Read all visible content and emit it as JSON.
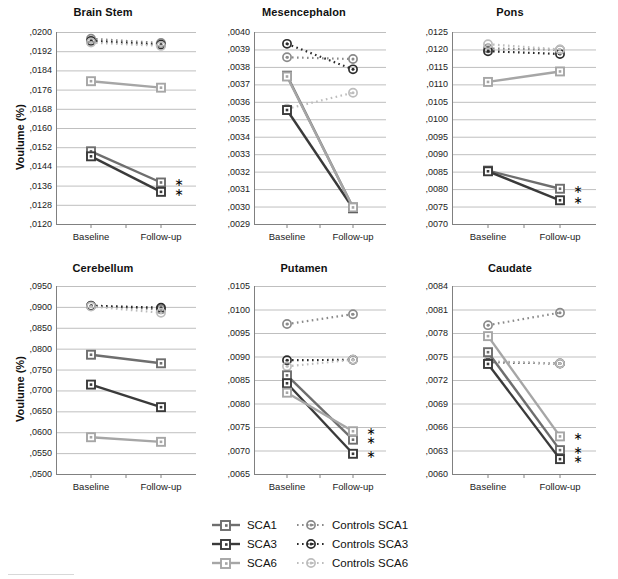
{
  "figure": {
    "y_axis_label": "Voulume (%)",
    "x_categories": [
      "Baseline",
      "Follow-up"
    ],
    "significance_marker": "∗",
    "colors": {
      "sca1": "#6e6e6e",
      "sca3": "#3a3a3a",
      "sca6": "#a6a6a6",
      "controls_sca1": "#8a8a8a",
      "controls_sca3": "#2b2b2b",
      "controls_sca6": "#bdbdbd",
      "gridline": "#bfbfbf",
      "axis": "#808080",
      "text": "#1a1a1a"
    }
  },
  "legend": {
    "entries": [
      {
        "label": "SCA1",
        "series_key": "sca1",
        "style": "solid-square"
      },
      {
        "label": "Controls SCA1",
        "series_key": "controls_sca1",
        "style": "dotted-circle"
      },
      {
        "label": "SCA3",
        "series_key": "sca3",
        "style": "solid-square"
      },
      {
        "label": "Controls SCA3",
        "series_key": "controls_sca3",
        "style": "dotted-circle"
      },
      {
        "label": "SCA6",
        "series_key": "sca6",
        "style": "solid-square"
      },
      {
        "label": "Controls SCA6",
        "series_key": "controls_sca6",
        "style": "dotted-circle"
      }
    ]
  },
  "chart_data": [
    {
      "type": "line",
      "title": "Brain Stem",
      "xlabel": "",
      "ylabel": "Voulume (%)",
      "x": [
        "Baseline",
        "Follow-up"
      ],
      "ylim": [
        0.012,
        0.02
      ],
      "ytick_step": 0.0008,
      "ytick_labels": [
        ",0120",
        ",0128",
        ",0136",
        ",0144",
        ",0152",
        ",0160",
        ",0168",
        ",0176",
        ",0184",
        ",0192",
        ",0200"
      ],
      "grid": true,
      "legend_position": "figure-bottom",
      "series": [
        {
          "name": "SCA1",
          "key": "sca1",
          "style": "solid-square",
          "values": [
            0.01503,
            0.01373
          ],
          "significant": true
        },
        {
          "name": "SCA3",
          "key": "sca3",
          "style": "solid-square",
          "values": [
            0.01482,
            0.01334
          ],
          "significant": true
        },
        {
          "name": "SCA6",
          "key": "sca6",
          "style": "solid-square",
          "values": [
            0.01795,
            0.01768
          ],
          "significant": false
        },
        {
          "name": "Controls SCA1",
          "key": "controls_sca1",
          "style": "dotted-circle",
          "values": [
            0.01972,
            0.01954
          ],
          "significant": false
        },
        {
          "name": "Controls SCA3",
          "key": "controls_sca3",
          "style": "dotted-circle",
          "values": [
            0.01963,
            0.01947
          ],
          "significant": false
        },
        {
          "name": "Controls SCA6",
          "key": "controls_sca6",
          "style": "dotted-circle",
          "values": [
            0.01956,
            0.01942
          ],
          "significant": false
        }
      ]
    },
    {
      "type": "line",
      "title": "Mesencephalon",
      "xlabel": "",
      "ylabel": "",
      "x": [
        "Baseline",
        "Follow-up"
      ],
      "ylim": [
        0.0029,
        0.004
      ],
      "ytick_step": 0.0001,
      "ytick_labels": [
        ",0029",
        ",0030",
        ",0031",
        ",0032",
        ",0033",
        ",0034",
        ",0035",
        ",0036",
        ",0037",
        ",0038",
        ",0039",
        ",0040"
      ],
      "grid": true,
      "legend_position": "figure-bottom",
      "series": [
        {
          "name": "SCA1",
          "key": "sca1",
          "style": "solid-square",
          "values": [
            0.00375,
            0.002995
          ],
          "significant": false
        },
        {
          "name": "SCA3",
          "key": "sca3",
          "style": "solid-square",
          "values": [
            0.003553,
            0.00299
          ],
          "significant": false
        },
        {
          "name": "SCA6",
          "key": "sca6",
          "style": "solid-square",
          "values": [
            0.003745,
            0.002995
          ],
          "significant": false
        },
        {
          "name": "Controls SCA1",
          "key": "controls_sca1",
          "style": "dotted-circle",
          "values": [
            0.003855,
            0.003845
          ],
          "significant": false
        },
        {
          "name": "Controls SCA3",
          "key": "controls_sca3",
          "style": "dotted-circle",
          "values": [
            0.003932,
            0.003786
          ],
          "significant": false
        },
        {
          "name": "Controls SCA6",
          "key": "controls_sca6",
          "style": "dotted-circle",
          "values": [
            0.00356,
            0.003652
          ],
          "significant": false
        }
      ]
    },
    {
      "type": "line",
      "title": "Pons",
      "xlabel": "",
      "ylabel": "",
      "x": [
        "Baseline",
        "Follow-up"
      ],
      "ylim": [
        0.007,
        0.0125
      ],
      "ytick_step": 0.0005,
      "ytick_labels": [
        ",0070",
        ",0075",
        ",0080",
        ",0085",
        ",0090",
        ",0095",
        ",0100",
        ",0105",
        ",0110",
        ",0115",
        ",0120",
        ",0125"
      ],
      "grid": true,
      "legend_position": "figure-bottom",
      "series": [
        {
          "name": "SCA1",
          "key": "sca1",
          "style": "solid-square",
          "values": [
            0.00853,
            0.00801
          ],
          "significant": true
        },
        {
          "name": "SCA3",
          "key": "sca3",
          "style": "solid-square",
          "values": [
            0.00851,
            0.00768
          ],
          "significant": true
        },
        {
          "name": "SCA6",
          "key": "sca6",
          "style": "solid-square",
          "values": [
            0.01107,
            0.01137
          ],
          "significant": false
        },
        {
          "name": "Controls SCA1",
          "key": "controls_sca1",
          "style": "dotted-circle",
          "values": [
            0.01203,
            0.01199
          ],
          "significant": false
        },
        {
          "name": "Controls SCA3",
          "key": "controls_sca3",
          "style": "dotted-circle",
          "values": [
            0.01195,
            0.01187
          ],
          "significant": false
        },
        {
          "name": "Controls SCA6",
          "key": "controls_sca6",
          "style": "dotted-circle",
          "values": [
            0.01215,
            0.012
          ],
          "significant": false
        }
      ]
    },
    {
      "type": "line",
      "title": "Cerebellum",
      "xlabel": "",
      "ylabel": "Voulume (%)",
      "x": [
        "Baseline",
        "Follow-up"
      ],
      "ylim": [
        0.05,
        0.095
      ],
      "ytick_step": 0.005,
      "ytick_labels": [
        ",0500",
        ",0550",
        ",0600",
        ",0650",
        ",0700",
        ",0750",
        ",0800",
        ",0850",
        ",0900",
        ",0950"
      ],
      "grid": true,
      "legend_position": "figure-bottom",
      "series": [
        {
          "name": "SCA1",
          "key": "sca1",
          "style": "solid-square",
          "values": [
            0.07855,
            0.0765
          ],
          "significant": false
        },
        {
          "name": "SCA3",
          "key": "sca3",
          "style": "solid-square",
          "values": [
            0.0714,
            0.066
          ],
          "significant": false
        },
        {
          "name": "SCA6",
          "key": "sca6",
          "style": "solid-square",
          "values": [
            0.0588,
            0.0577
          ],
          "significant": false
        },
        {
          "name": "Controls SCA1",
          "key": "controls_sca1",
          "style": "dotted-circle",
          "values": [
            0.0902,
            0.0894
          ],
          "significant": false
        },
        {
          "name": "Controls SCA3",
          "key": "controls_sca3",
          "style": "dotted-circle",
          "values": [
            0.0903,
            0.0898
          ],
          "significant": false
        },
        {
          "name": "Controls SCA6",
          "key": "controls_sca6",
          "style": "dotted-circle",
          "values": [
            0.0901,
            0.0886
          ],
          "significant": false
        }
      ]
    },
    {
      "type": "line",
      "title": "Putamen",
      "xlabel": "",
      "ylabel": "",
      "x": [
        "Baseline",
        "Follow-up"
      ],
      "ylim": [
        0.0065,
        0.0105
      ],
      "ytick_step": 0.0005,
      "ytick_labels": [
        ",0065",
        ",0070",
        ",0075",
        ",0080",
        ",0085",
        ",0090",
        ",0095",
        ",0100",
        ",0105"
      ],
      "grid": true,
      "legend_position": "figure-bottom",
      "series": [
        {
          "name": "SCA1",
          "key": "sca1",
          "style": "solid-square",
          "values": [
            0.0086,
            0.00723
          ],
          "significant": true
        },
        {
          "name": "SCA3",
          "key": "sca3",
          "style": "solid-square",
          "values": [
            0.00843,
            0.00693
          ],
          "significant": true
        },
        {
          "name": "SCA6",
          "key": "sca6",
          "style": "solid-square",
          "values": [
            0.00823,
            0.00741
          ],
          "significant": true
        },
        {
          "name": "Controls SCA1",
          "key": "controls_sca1",
          "style": "dotted-circle",
          "values": [
            0.00969,
            0.0099
          ],
          "significant": false
        },
        {
          "name": "Controls SCA3",
          "key": "controls_sca3",
          "style": "dotted-circle",
          "values": [
            0.00892,
            0.00893
          ],
          "significant": false
        },
        {
          "name": "Controls SCA6",
          "key": "controls_sca6",
          "style": "dotted-circle",
          "values": [
            0.00879,
            0.00893
          ],
          "significant": false
        }
      ]
    },
    {
      "type": "line",
      "title": "Caudate",
      "xlabel": "",
      "ylabel": "",
      "x": [
        "Baseline",
        "Follow-up"
      ],
      "ylim": [
        0.006,
        0.0084
      ],
      "ytick_step": 0.0003,
      "ytick_labels": [
        ",0060",
        ",0063",
        ",0066",
        ",0069",
        ",0072",
        ",0075",
        ",0078",
        ",0081",
        ",0084"
      ],
      "grid": true,
      "legend_position": "figure-bottom",
      "series": [
        {
          "name": "SCA1",
          "key": "sca1",
          "style": "solid-square",
          "values": [
            0.007555,
            0.006305
          ],
          "significant": true
        },
        {
          "name": "SCA3",
          "key": "sca3",
          "style": "solid-square",
          "values": [
            0.007405,
            0.00619
          ],
          "significant": true
        },
        {
          "name": "SCA6",
          "key": "sca6",
          "style": "solid-square",
          "values": [
            0.00776,
            0.00648
          ],
          "significant": true
        },
        {
          "name": "Controls SCA1",
          "key": "controls_sca1",
          "style": "dotted-circle",
          "values": [
            0.0079,
            0.00806
          ],
          "significant": false
        },
        {
          "name": "Controls SCA3",
          "key": "controls_sca3",
          "style": "dotted-circle",
          "values": [
            0.00743,
            0.00741
          ],
          "significant": false
        },
        {
          "name": "Controls SCA6",
          "key": "controls_sca6",
          "style": "dotted-circle",
          "values": [
            0.00744,
            0.00741
          ],
          "significant": false
        }
      ]
    }
  ]
}
